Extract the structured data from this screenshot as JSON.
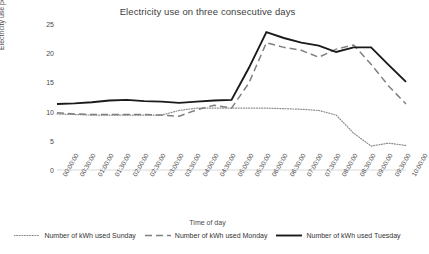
{
  "chart_data": {
    "type": "line",
    "title": "Electricity use on three consecutive days",
    "xlabel": "Time of day",
    "ylabel": "Electricity use per hour (kWh)",
    "ylim": [
      0,
      25
    ],
    "yticks": [
      0,
      5,
      10,
      15,
      20,
      25
    ],
    "grid": false,
    "legend_position": "bottom",
    "categories": [
      "00:00:00",
      "00:30:00",
      "01:00:00",
      "01:30:00",
      "02:00:00",
      "02:30:00",
      "03:00:00",
      "03:30:00",
      "04:00:00",
      "04:30:00",
      "05:00:00",
      "05:30:00",
      "06:00:00",
      "06:30:00",
      "07:00:00",
      "07:30:00",
      "08:00:00",
      "08:30:00",
      "09:00:00",
      "09:30:00",
      "10:00:00"
    ],
    "series": [
      {
        "name": "Number of kWh used Sunday",
        "style": "dotted",
        "color": "#8c8c8c",
        "values": [
          9.6,
          9.5,
          9.4,
          9.4,
          9.4,
          9.4,
          9.4,
          10.2,
          10.6,
          10.6,
          10.6,
          10.6,
          10.6,
          10.5,
          10.4,
          10.2,
          9.4,
          6.3,
          4.1,
          4.6,
          4.2
        ]
      },
      {
        "name": "Number of kWh used Monday",
        "style": "dashed",
        "color": "#808080",
        "values": [
          9.8,
          9.6,
          9.5,
          9.5,
          9.5,
          9.5,
          9.4,
          9.2,
          10.3,
          11.1,
          10.6,
          14.9,
          21.8,
          21.0,
          20.5,
          19.3,
          20.7,
          21.4,
          18.1,
          14.4,
          11.3
        ]
      },
      {
        "name": "Number of kWh used Tuesday",
        "style": "solid",
        "color": "#1a1a1a",
        "values": [
          11.3,
          11.4,
          11.6,
          11.9,
          12.0,
          11.8,
          11.7,
          11.5,
          11.7,
          11.9,
          12.0,
          17.5,
          23.6,
          22.6,
          21.8,
          21.3,
          20.2,
          21.0,
          21.0,
          18.0,
          15.1
        ]
      }
    ]
  },
  "axis": {
    "ytick_labels": [
      "0",
      "5",
      "10",
      "15",
      "20",
      "25"
    ]
  }
}
